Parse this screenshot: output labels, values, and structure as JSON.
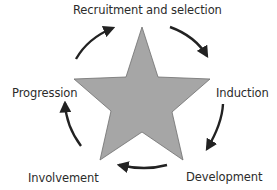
{
  "diagram": {
    "type": "cycle",
    "center_shape": "star",
    "colors": {
      "star_fill": "#a6a6a6",
      "star_stroke": "#6e6e6e",
      "arrow": "#222222",
      "text": "#2b2b2b",
      "background": "#ffffff"
    },
    "stages": [
      {
        "label": "Recruitment and selection"
      },
      {
        "label": "Induction"
      },
      {
        "label": "Development"
      },
      {
        "label": "Involvement"
      },
      {
        "label": "Progression"
      }
    ],
    "arrows": [
      {
        "from": "Recruitment and selection",
        "to": "Induction",
        "direction": "clockwise"
      },
      {
        "from": "Induction",
        "to": "Development",
        "direction": "clockwise"
      },
      {
        "from": "Development",
        "to": "Involvement",
        "direction": "clockwise"
      },
      {
        "from": "Involvement",
        "to": "Progression",
        "direction": "clockwise"
      },
      {
        "from": "Progression",
        "to": "Recruitment and selection",
        "direction": "clockwise"
      }
    ]
  }
}
